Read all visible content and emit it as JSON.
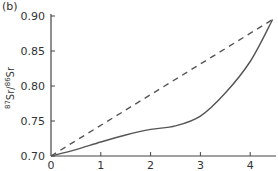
{
  "panel_label": "(b)",
  "chart_data": {
    "type": "line",
    "title": "",
    "xlabel": "",
    "ylabel": "87Sr/86Sr",
    "xlim": [
      0,
      4.5
    ],
    "ylim": [
      0.7,
      0.9
    ],
    "xticks": [
      "0",
      "1",
      "2",
      "3",
      "4"
    ],
    "yticks": [
      "0.70",
      "0.75",
      "0.80",
      "0.85",
      "0.90"
    ],
    "grid": false,
    "series": [
      {
        "name": "dashed",
        "style": "dashed",
        "x": [
          0,
          4.45
        ],
        "y": [
          0.7,
          0.895
        ]
      },
      {
        "name": "solid",
        "style": "solid",
        "x": [
          0,
          0.5,
          1.0,
          1.5,
          2.0,
          2.5,
          3.0,
          3.5,
          4.0,
          4.45
        ],
        "y": [
          0.7,
          0.709,
          0.72,
          0.73,
          0.738,
          0.743,
          0.757,
          0.79,
          0.835,
          0.895
        ]
      }
    ]
  }
}
